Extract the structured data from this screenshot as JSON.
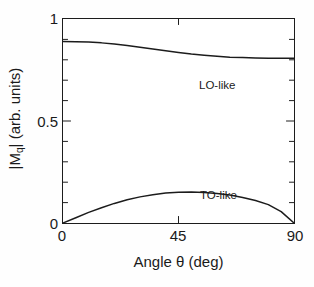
{
  "chart_data": {
    "type": "line",
    "title": "",
    "subtitle": "",
    "xlabel": "Angle θ (deg)",
    "ylabel": "|Mq| (arb. units)",
    "ylabel_base": "|M",
    "ylabel_sub": "q",
    "ylabel_tail": "| (arb. units)",
    "xlim": [
      0,
      90
    ],
    "ylim": [
      0,
      1
    ],
    "xticks": [
      0,
      45,
      90
    ],
    "xticklabels": [
      "0",
      "45",
      "90"
    ],
    "yticks": [
      0,
      0.5,
      1
    ],
    "yticklabels": [
      "0",
      "0.5",
      "1"
    ],
    "minor_yticks": [
      0.1,
      0.2,
      0.3,
      0.4,
      0.6,
      0.7,
      0.8,
      0.9
    ],
    "grid": false,
    "legend_position": "inline-annotations",
    "line_color": "#1c1c1c",
    "frame_color": "#1c1c1c",
    "background_color": "#ffffff",
    "x": [
      0,
      5,
      10,
      15,
      20,
      25,
      30,
      35,
      40,
      45,
      50,
      55,
      60,
      65,
      70,
      75,
      80,
      85,
      90
    ],
    "series": [
      {
        "name": "LO-like",
        "annotation": "LO-like",
        "values": [
          0.89,
          0.889,
          0.887,
          0.883,
          0.877,
          0.87,
          0.862,
          0.853,
          0.844,
          0.836,
          0.828,
          0.822,
          0.817,
          0.813,
          0.811,
          0.809,
          0.808,
          0.808,
          0.808
        ]
      },
      {
        "name": "TO-like",
        "annotation": "TO-like",
        "values": [
          0.0,
          0.026,
          0.052,
          0.075,
          0.096,
          0.114,
          0.128,
          0.139,
          0.147,
          0.151,
          0.152,
          0.15,
          0.145,
          0.137,
          0.125,
          0.11,
          0.09,
          0.056,
          0.0
        ]
      }
    ]
  },
  "axes": {
    "x_title": "Angle θ (deg)",
    "y_title_base": "|M",
    "y_title_sub": "q",
    "y_title_tail": "| (arb. units)",
    "x_tick_0": "0",
    "x_tick_45": "45",
    "x_tick_90": "90",
    "y_tick_0": "0",
    "y_tick_05": "0.5",
    "y_tick_1": "1"
  },
  "annotations": {
    "lo_like": "LO-like",
    "to_like": "TO-like"
  }
}
